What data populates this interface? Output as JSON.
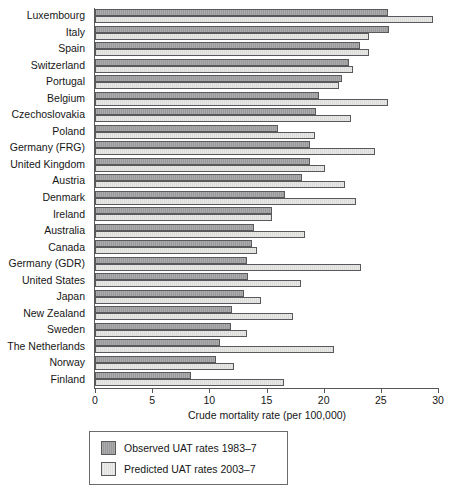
{
  "chart_data": {
    "type": "bar",
    "orientation": "horizontal",
    "title": "",
    "xlabel": "Crude mortality rate (per 100,000)",
    "ylabel": "",
    "xlim": [
      0,
      30
    ],
    "xticks": [
      0,
      5,
      10,
      15,
      20,
      25,
      30
    ],
    "xticklabels": [
      "0",
      "5",
      "10",
      "15",
      "20",
      "25",
      "30"
    ],
    "grid": false,
    "legend_position": "below-axes",
    "categories": [
      "Luxembourg",
      "Italy",
      "Spain",
      "Switzerland",
      "Portugal",
      "Belgium",
      "Czechoslovakia",
      "Poland",
      "Germany (FRG)",
      "United Kingdom",
      "Austria",
      "Denmark",
      "Ireland",
      "Australia",
      "Canada",
      "Germany (GDR)",
      "United States",
      "Japan",
      "New Zealand",
      "Sweden",
      "The Netherlands",
      "Norway",
      "Finland"
    ],
    "series": [
      {
        "name": "Observed UAT rates 1983–7",
        "color": "#9a9a9c",
        "values": [
          25.6,
          25.7,
          23.2,
          22.2,
          21.6,
          19.6,
          19.3,
          16.0,
          18.8,
          18.8,
          18.1,
          16.6,
          15.5,
          13.9,
          13.7,
          13.3,
          13.4,
          13.0,
          12.0,
          11.9,
          10.9,
          10.6,
          8.4
        ]
      },
      {
        "name": "Predicted UAT rates 2003–7",
        "color": "#e8e8e6",
        "values": [
          29.6,
          24.0,
          24.0,
          22.6,
          21.3,
          25.6,
          22.4,
          19.2,
          24.5,
          20.1,
          21.9,
          22.8,
          15.5,
          18.4,
          14.2,
          23.3,
          18.0,
          14.5,
          17.3,
          13.3,
          20.9,
          12.2,
          16.5
        ]
      }
    ]
  },
  "legend": {
    "items": [
      {
        "label": "Observed UAT rates 1983–7",
        "swatch": "observed"
      },
      {
        "label": "Predicted UAT rates 2003–7",
        "swatch": "predicted"
      }
    ]
  }
}
